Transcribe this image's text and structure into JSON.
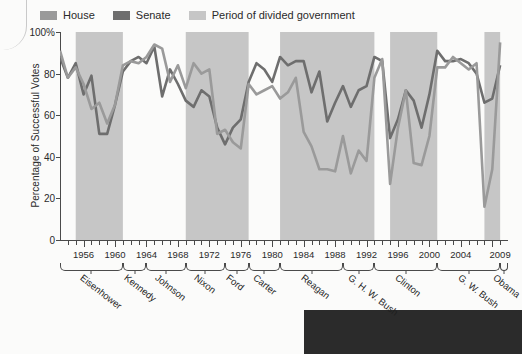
{
  "legend": {
    "items": [
      {
        "label": "House",
        "color": "#9a9a9a",
        "icon": "legend-swatch"
      },
      {
        "label": "Senate",
        "color": "#6e6e6e",
        "icon": "legend-swatch"
      },
      {
        "label": "Period of divided government",
        "color": "#c6c6c6",
        "icon": "legend-swatch"
      }
    ]
  },
  "axes": {
    "y_title": "Percentage of Successful Votes",
    "y_ticks": [
      "0",
      "20",
      "40",
      "60",
      "80",
      "100%"
    ],
    "x_ticks": [
      "1956",
      "1960",
      "1964",
      "1968",
      "1972",
      "1976",
      "1980",
      "1984",
      "1988",
      "1992",
      "1996",
      "2000",
      "2004",
      "2009"
    ]
  },
  "presidents": [
    {
      "name": "Eisenhower",
      "start": 1953,
      "end": 1961
    },
    {
      "name": "Kennedy",
      "start": 1961,
      "end": 1964
    },
    {
      "name": "Johnson",
      "start": 1964,
      "end": 1969
    },
    {
      "name": "Nixon",
      "start": 1969,
      "end": 1974
    },
    {
      "name": "Ford",
      "start": 1974,
      "end": 1977
    },
    {
      "name": "Carter",
      "start": 1977,
      "end": 1981
    },
    {
      "name": "Reagan",
      "start": 1981,
      "end": 1989
    },
    {
      "name": "G. H. W. Bush",
      "start": 1989,
      "end": 1993
    },
    {
      "name": "Clinton",
      "start": 1993,
      "end": 2001
    },
    {
      "name": "G. W. Bush",
      "start": 2001,
      "end": 2009
    },
    {
      "name": "Obama",
      "start": 2009,
      "end": 2010
    }
  ],
  "chart_data": {
    "type": "line",
    "title": "",
    "xlabel": "",
    "ylabel": "Percentage of Successful Votes",
    "ylim": [
      0,
      100
    ],
    "xlim": [
      1953,
      2010
    ],
    "grid": false,
    "legend_position": "top-left",
    "x": [
      1953,
      1954,
      1955,
      1956,
      1957,
      1958,
      1959,
      1960,
      1961,
      1962,
      1963,
      1964,
      1965,
      1966,
      1967,
      1968,
      1969,
      1970,
      1971,
      1972,
      1973,
      1974,
      1975,
      1976,
      1977,
      1978,
      1979,
      1980,
      1981,
      1982,
      1983,
      1984,
      1985,
      1986,
      1987,
      1988,
      1989,
      1990,
      1991,
      1992,
      1993,
      1994,
      1995,
      1996,
      1997,
      1998,
      1999,
      2000,
      2001,
      2002,
      2003,
      2004,
      2005,
      2006,
      2007,
      2008,
      2009
    ],
    "series": [
      {
        "name": "House",
        "color": "#9a9a9a",
        "values": [
          91,
          78,
          83,
          75,
          63,
          66,
          56,
          65,
          84,
          86,
          85,
          88,
          94,
          92,
          76,
          84,
          73,
          85,
          80,
          82,
          51,
          53,
          47,
          44,
          75,
          70,
          72,
          74,
          68,
          71,
          78,
          52,
          45,
          34,
          34,
          33,
          50,
          32,
          43,
          38,
          78,
          87,
          27,
          54,
          72,
          37,
          36,
          50,
          83,
          83,
          88,
          85,
          82,
          85,
          16,
          34,
          95
        ]
      },
      {
        "name": "Senate",
        "color": "#6e6e6e",
        "values": [
          88,
          78,
          85,
          70,
          79,
          51,
          51,
          65,
          81,
          86,
          88,
          85,
          93,
          69,
          82,
          75,
          67,
          64,
          72,
          69,
          54,
          46,
          54,
          58,
          76,
          85,
          82,
          76,
          88,
          84,
          86,
          86,
          71,
          81,
          57,
          66,
          74,
          64,
          72,
          74,
          88,
          86,
          49,
          58,
          72,
          67,
          54,
          70,
          91,
          86,
          86,
          87,
          85,
          80,
          66,
          68,
          84
        ]
      }
    ],
    "divided_government_periods": [
      {
        "start": 1955,
        "end": 1961
      },
      {
        "start": 1969,
        "end": 1977
      },
      {
        "start": 1981,
        "end": 1993
      },
      {
        "start": 1995,
        "end": 2001
      },
      {
        "start": 2007,
        "end": 2009
      }
    ]
  }
}
